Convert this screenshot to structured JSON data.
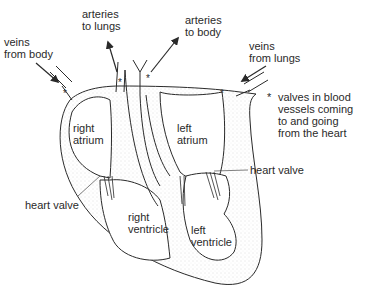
{
  "diagram": {
    "labels": {
      "veins_from_body": [
        "veins",
        "from body"
      ],
      "arteries_to_lungs": [
        "arteries",
        "to lungs"
      ],
      "arteries_to_body": [
        "arteries",
        "to body"
      ],
      "veins_from_lungs": [
        "veins",
        "from lungs"
      ],
      "right_atrium": [
        "right",
        "atrium"
      ],
      "left_atrium": [
        "left",
        "atrium"
      ],
      "right_ventricle": [
        "right",
        "ventricle"
      ],
      "left_ventricle": [
        "left",
        "ventricle"
      ],
      "heart_valve_left": "heart valve",
      "heart_valve_right": "heart valve"
    },
    "legend": {
      "marker": "*",
      "text": [
        "valves in blood",
        "vessels coming",
        "to and going",
        "from the heart"
      ]
    },
    "colors": {
      "line": "#2a2a2a",
      "stipple": "#d8d8d8",
      "background": "#ffffff"
    }
  }
}
